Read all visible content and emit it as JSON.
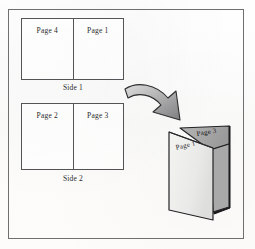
{
  "figure": {
    "background_color": "#fdfdfc",
    "frame_color": "#6f6f70"
  },
  "sheets": [
    {
      "id": "side-1",
      "side_label": "Side 1",
      "halves": [
        {
          "position": "left",
          "label": "Page 4"
        },
        {
          "position": "right",
          "label": "Page 1"
        }
      ]
    },
    {
      "id": "side-2",
      "side_label": "Side 2",
      "halves": [
        {
          "position": "left",
          "label": "Page 2"
        },
        {
          "position": "right",
          "label": "Page 3"
        }
      ]
    }
  ],
  "arrow": {
    "name": "curved-arrow",
    "direction": "down-right",
    "fill_start": "#d8d8d8",
    "fill_end": "#828284",
    "outline": "#2e2e30"
  },
  "booklet": {
    "name": "folded-booklet",
    "front_label": "Page 1",
    "back_label": "Page 3",
    "front_color": "#ededeb",
    "back_color": "#a9a9aa",
    "spine_color": "#1a1a1c",
    "outline": "#232325"
  }
}
